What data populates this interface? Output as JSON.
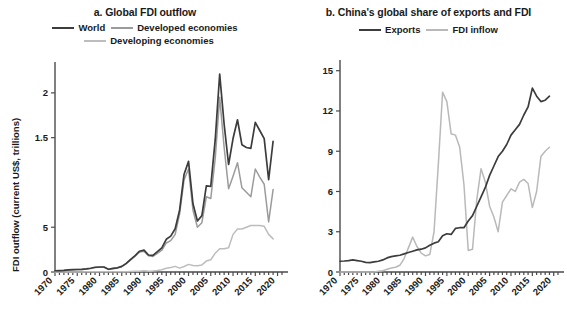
{
  "figure": {
    "panels": [
      {
        "key": "a",
        "title": "a. Global FDI outflow",
        "ylabel": "FDI outflow (current US$, trillions)"
      },
      {
        "key": "b",
        "title": "b. China's global share of exports and FDI",
        "ylabel": "Global share (%)"
      }
    ]
  },
  "colors": {
    "world": "#3c3c3c",
    "developed": "#9b9b9b",
    "developing": "#bdbdbd",
    "exports": "#3c3c3c",
    "fdi_inflow": "#b9b9b9",
    "axis": "#4a4a4a",
    "text": "#1a1a1a",
    "background": "#ffffff"
  },
  "chart_data": [
    {
      "type": "line",
      "title": "a. Global FDI outflow",
      "xlabel": "",
      "ylabel": "FDI outflow (current US$, trillions)",
      "xlim": [
        1970,
        2021
      ],
      "ylim": [
        0,
        2.3
      ],
      "xticks": [
        1970,
        1975,
        1980,
        1985,
        1990,
        1995,
        2000,
        2005,
        2010,
        2015,
        2020
      ],
      "xticklabels": [
        "1970",
        "1975",
        "1980",
        "1985",
        "1990",
        "1995",
        "2000",
        "2005",
        "2010",
        "2015",
        "2020"
      ],
      "yticks": [
        0,
        0.5,
        1.5,
        2
      ],
      "yticklabels": [
        "0",
        "5",
        "1.5",
        "2"
      ],
      "grid": false,
      "legend_position": "top",
      "x": [
        1970,
        1971,
        1972,
        1973,
        1974,
        1975,
        1976,
        1977,
        1978,
        1979,
        1980,
        1981,
        1982,
        1983,
        1984,
        1985,
        1986,
        1987,
        1988,
        1989,
        1990,
        1991,
        1992,
        1993,
        1994,
        1995,
        1996,
        1997,
        1998,
        1999,
        2000,
        2001,
        2002,
        2003,
        2004,
        2005,
        2006,
        2007,
        2008,
        2009,
        2010,
        2011,
        2012,
        2013,
        2014,
        2015,
        2016,
        2017,
        2018,
        2019
      ],
      "series": [
        {
          "name": "World",
          "color": "#3c3c3c",
          "values": [
            0.014,
            0.016,
            0.018,
            0.023,
            0.027,
            0.028,
            0.03,
            0.035,
            0.042,
            0.053,
            0.056,
            0.056,
            0.031,
            0.04,
            0.047,
            0.063,
            0.096,
            0.141,
            0.184,
            0.232,
            0.245,
            0.19,
            0.186,
            0.227,
            0.269,
            0.365,
            0.4,
            0.483,
            0.693,
            1.092,
            1.235,
            0.762,
            0.57,
            0.629,
            0.962,
            0.957,
            1.48,
            2.21,
            1.65,
            1.2,
            1.49,
            1.7,
            1.42,
            1.39,
            1.38,
            1.67,
            1.58,
            1.49,
            1.03,
            1.46
          ]
        },
        {
          "name": "Developed economies",
          "color": "#9b9b9b",
          "values": [
            0.013,
            0.015,
            0.017,
            0.022,
            0.026,
            0.027,
            0.029,
            0.033,
            0.04,
            0.051,
            0.054,
            0.054,
            0.029,
            0.037,
            0.044,
            0.059,
            0.092,
            0.135,
            0.177,
            0.223,
            0.232,
            0.181,
            0.174,
            0.209,
            0.243,
            0.324,
            0.35,
            0.42,
            0.65,
            1.03,
            1.15,
            0.69,
            0.5,
            0.55,
            0.84,
            0.82,
            1.27,
            1.95,
            1.39,
            0.93,
            1.07,
            1.22,
            0.94,
            0.89,
            0.84,
            1.15,
            1.06,
            0.98,
            0.56,
            0.92
          ]
        },
        {
          "name": "Developing economies",
          "color": "#bdbdbd",
          "values": [
            0.001,
            0.001,
            0.001,
            0.001,
            0.001,
            0.001,
            0.001,
            0.002,
            0.002,
            0.002,
            0.002,
            0.002,
            0.002,
            0.003,
            0.003,
            0.004,
            0.004,
            0.006,
            0.007,
            0.009,
            0.013,
            0.009,
            0.012,
            0.018,
            0.026,
            0.041,
            0.05,
            0.063,
            0.043,
            0.062,
            0.085,
            0.072,
            0.07,
            0.079,
            0.122,
            0.137,
            0.21,
            0.26,
            0.26,
            0.27,
            0.42,
            0.48,
            0.48,
            0.5,
            0.52,
            0.52,
            0.52,
            0.51,
            0.42,
            0.37
          ]
        }
      ]
    },
    {
      "type": "line",
      "title": "b. China's global share of exports and FDI",
      "xlabel": "",
      "ylabel": "Global share (%)",
      "xlim": [
        1970,
        2021
      ],
      "ylim": [
        0,
        15.5
      ],
      "xticks": [
        1970,
        1975,
        1980,
        1985,
        1990,
        1995,
        2000,
        2005,
        2010,
        2015,
        2020
      ],
      "xticklabels": [
        "1970",
        "1975",
        "1980",
        "1985",
        "1990",
        "1995",
        "2000",
        "2005",
        "2010",
        "2015",
        "2020"
      ],
      "yticks": [
        0,
        3,
        6,
        9,
        12,
        15
      ],
      "yticklabels": [
        "0",
        "3",
        "6",
        "9",
        "12",
        "15"
      ],
      "grid": false,
      "legend_position": "top",
      "x": [
        1970,
        1971,
        1972,
        1973,
        1974,
        1975,
        1976,
        1977,
        1978,
        1979,
        1980,
        1981,
        1982,
        1983,
        1984,
        1985,
        1986,
        1987,
        1988,
        1989,
        1990,
        1991,
        1992,
        1993,
        1994,
        1995,
        1996,
        1997,
        1998,
        1999,
        2000,
        2001,
        2002,
        2003,
        2004,
        2005,
        2006,
        2007,
        2008,
        2009,
        2010,
        2011,
        2012,
        2013,
        2014,
        2015,
        2016,
        2017,
        2018,
        2019
      ],
      "series": [
        {
          "name": "Exports",
          "color": "#3c3c3c",
          "values": [
            0.8,
            0.82,
            0.85,
            0.9,
            0.85,
            0.8,
            0.72,
            0.7,
            0.75,
            0.8,
            0.9,
            1.05,
            1.15,
            1.2,
            1.25,
            1.35,
            1.45,
            1.55,
            1.65,
            1.7,
            1.8,
            2.0,
            2.15,
            2.25,
            2.7,
            2.85,
            2.8,
            3.25,
            3.3,
            3.3,
            3.8,
            4.2,
            4.9,
            5.6,
            6.3,
            7.2,
            7.9,
            8.6,
            9.0,
            9.5,
            10.2,
            10.6,
            11.0,
            11.7,
            12.3,
            13.7,
            13.1,
            12.7,
            12.8,
            13.1
          ]
        },
        {
          "name": "FDI inflow",
          "color": "#b9b9b9",
          "values": [
            0.0,
            0.0,
            0.0,
            0.0,
            0.0,
            0.0,
            0.0,
            0.0,
            0.0,
            0.05,
            0.1,
            0.2,
            0.3,
            0.35,
            0.5,
            1.0,
            1.8,
            2.6,
            1.9,
            1.4,
            1.2,
            1.3,
            3.0,
            8.0,
            13.4,
            12.7,
            10.3,
            10.2,
            9.3,
            6.5,
            1.6,
            1.7,
            5.4,
            7.7,
            6.7,
            4.9,
            4.1,
            3.0,
            5.2,
            5.7,
            6.2,
            6.0,
            6.7,
            6.9,
            6.6,
            4.8,
            6.0,
            8.6,
            9.0,
            9.3
          ]
        }
      ]
    }
  ]
}
